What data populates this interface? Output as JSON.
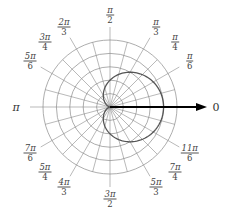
{
  "diagram": {
    "type": "polar-grid",
    "center": [
      110,
      107
    ],
    "ring_count": 5,
    "ring_spacing_px": 13.4,
    "spoke_step_deg": 15,
    "spoke_length_px": 80,
    "colors": {
      "grid": "#8a8a8a",
      "curve": "#555555",
      "axis": "#000000",
      "text": "#444444"
    },
    "polar_axis_label": "0",
    "angle_labels": [
      {
        "num": "π",
        "den": "6",
        "deg": 30
      },
      {
        "num": "π",
        "den": "4",
        "deg": 45
      },
      {
        "num": "π",
        "den": "3",
        "deg": 60
      },
      {
        "num": "π",
        "den": "2",
        "deg": 90
      },
      {
        "num": "2π",
        "den": "3",
        "deg": 120
      },
      {
        "num": "3π",
        "den": "4",
        "deg": 135
      },
      {
        "num": "5π",
        "den": "6",
        "deg": 150
      },
      {
        "num": "π",
        "den": "",
        "deg": 180
      },
      {
        "num": "7π",
        "den": "6",
        "deg": 210
      },
      {
        "num": "5π",
        "den": "4",
        "deg": 225
      },
      {
        "num": "4π",
        "den": "3",
        "deg": 240
      },
      {
        "num": "3π",
        "den": "2",
        "deg": 270
      },
      {
        "num": "5π",
        "den": "3",
        "deg": 300
      },
      {
        "num": "7π",
        "den": "4",
        "deg": 315
      },
      {
        "num": "11π",
        "den": "6",
        "deg": 330
      }
    ],
    "curve": {
      "equation": "r = 2(1 + cos θ)",
      "a_rings": 2
    }
  }
}
